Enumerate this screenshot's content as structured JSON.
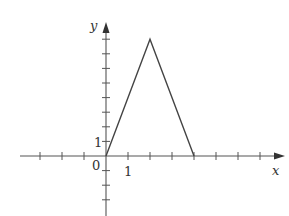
{
  "chart_data": {
    "type": "line",
    "title": "",
    "xlabel": "x",
    "ylabel": "y",
    "x": [
      0,
      2,
      4
    ],
    "values": [
      0,
      8,
      0
    ],
    "series": [
      {
        "name": "triangle",
        "points": [
          [
            0,
            0
          ],
          [
            2,
            8
          ],
          [
            4,
            0
          ]
        ]
      }
    ],
    "xlim": [
      -4,
      8
    ],
    "ylim": [
      -3,
      9
    ],
    "tick_labels": {
      "origin": "0",
      "x_one": "1",
      "y_one": "1"
    },
    "grid": false,
    "legend": "none"
  },
  "axis": {
    "x_label": "x",
    "y_label": "y",
    "origin": "0",
    "x_unit": "1",
    "y_unit": "1"
  },
  "colors": {
    "line": "#444444",
    "axis": "#555555"
  }
}
